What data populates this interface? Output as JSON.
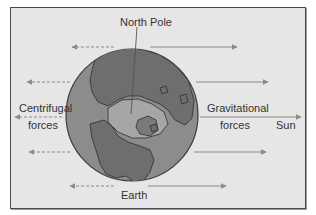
{
  "diagram": {
    "labels": {
      "north_pole": "North Pole",
      "centrifugal_line1": "Centrifugal",
      "centrifugal_line2": "forces",
      "gravitational_line1": "Gravitational",
      "gravitational_line2": "forces",
      "sun": "Sun",
      "earth": "Earth"
    },
    "colors": {
      "background": "#e6e6e6",
      "frame_border": "#4a4a4a",
      "ocean": "#8c8c8c",
      "land": "#6e6e6e",
      "ice": "#a8a8a8",
      "arrow": "#8a8a8a",
      "text": "#333333"
    },
    "arrows": {
      "centrifugal_dashed_left": [
        {
          "y": 47,
          "x_from": 114,
          "x_to": 70
        },
        {
          "y": 82,
          "x_from": 70,
          "x_to": 25
        },
        {
          "y": 117,
          "x_from": 60,
          "x_to": 13
        },
        {
          "y": 152,
          "x_from": 70,
          "x_to": 27
        },
        {
          "y": 186,
          "x_from": 114,
          "x_to": 68
        }
      ],
      "gravitational_solid_right": [
        {
          "y": 47,
          "x_from": 150,
          "x_to": 239
        },
        {
          "y": 82,
          "x_from": 196,
          "x_to": 270
        },
        {
          "y": 117,
          "x_from": 200,
          "x_to": 303
        },
        {
          "y": 152,
          "x_from": 194,
          "x_to": 268
        },
        {
          "y": 186,
          "x_from": 148,
          "x_to": 228
        }
      ]
    }
  }
}
